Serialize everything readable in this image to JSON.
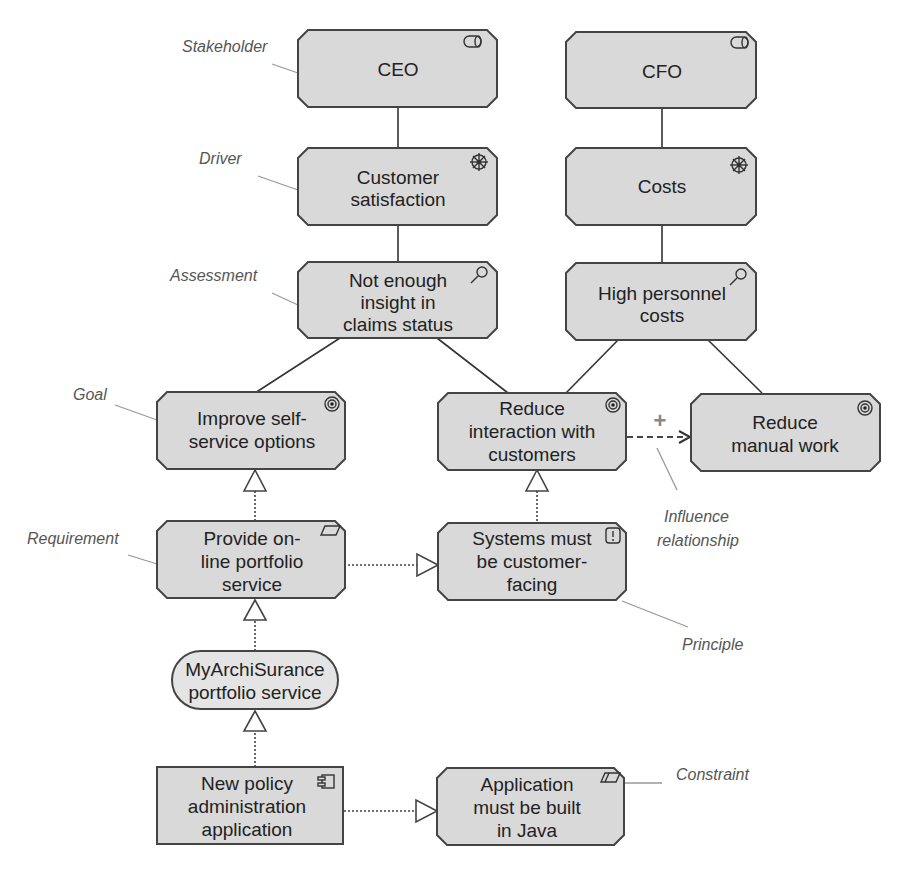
{
  "diagram": {
    "colors": {
      "node_fill": "#d9d9d9",
      "service_fill": "#e4e4e4",
      "stroke": "#444444",
      "annotation": "#555555"
    },
    "nodes": {
      "ceo": {
        "type": "Stakeholder",
        "icon": "stakeholder-icon",
        "lines": [
          "CEO"
        ]
      },
      "cfo": {
        "type": "Stakeholder",
        "icon": "stakeholder-icon",
        "lines": [
          "CFO"
        ]
      },
      "customer_satisfaction": {
        "type": "Driver",
        "icon": "driver-icon",
        "lines": [
          "Customer",
          "satisfaction"
        ]
      },
      "costs": {
        "type": "Driver",
        "icon": "driver-icon",
        "lines": [
          "Costs"
        ]
      },
      "not_enough_insight": {
        "type": "Assessment",
        "icon": "assessment-icon",
        "lines": [
          "Not enough",
          "insight in",
          "claims status"
        ]
      },
      "high_personnel_costs": {
        "type": "Assessment",
        "icon": "assessment-icon",
        "lines": [
          "High personnel",
          "costs"
        ]
      },
      "improve_self_service": {
        "type": "Goal",
        "icon": "goal-icon",
        "lines": [
          "Improve self-",
          "service options"
        ]
      },
      "reduce_interaction": {
        "type": "Goal",
        "icon": "goal-icon",
        "lines": [
          "Reduce",
          "interaction with",
          "customers"
        ]
      },
      "reduce_manual_work": {
        "type": "Goal",
        "icon": "goal-icon",
        "lines": [
          "Reduce",
          "manual work"
        ]
      },
      "provide_online_portfolio": {
        "type": "Requirement",
        "icon": "requirement-icon",
        "lines": [
          "Provide on-",
          "line portfolio",
          "service"
        ]
      },
      "systems_customer_facing": {
        "type": "Principle",
        "icon": "principle-icon",
        "lines": [
          "Systems must",
          "be customer-",
          "facing"
        ]
      },
      "myarchisurance_service": {
        "type": "Application Service",
        "icon": "",
        "lines": [
          "MyArchiSurance",
          "portfolio service"
        ]
      },
      "new_policy_admin_app": {
        "type": "Application Component",
        "icon": "component-icon",
        "lines": [
          "New policy",
          "administration",
          "application"
        ]
      },
      "application_java": {
        "type": "Constraint",
        "icon": "constraint-icon",
        "lines": [
          "Application",
          "must be built",
          "in Java"
        ]
      }
    },
    "annotations": {
      "stakeholder": "Stakeholder",
      "driver": "Driver",
      "assessment": "Assessment",
      "goal": "Goal",
      "requirement": "Requirement",
      "influence": [
        "Influence",
        "relationship"
      ],
      "principle": "Principle",
      "constraint": "Constraint"
    },
    "influence_sign": "+",
    "relationships": [
      {
        "from": "ceo",
        "to": "customer_satisfaction",
        "type": "association"
      },
      {
        "from": "cfo",
        "to": "costs",
        "type": "association"
      },
      {
        "from": "customer_satisfaction",
        "to": "not_enough_insight",
        "type": "association"
      },
      {
        "from": "costs",
        "to": "high_personnel_costs",
        "type": "association"
      },
      {
        "from": "not_enough_insight",
        "to": "improve_self_service",
        "type": "association"
      },
      {
        "from": "not_enough_insight",
        "to": "reduce_interaction",
        "type": "association"
      },
      {
        "from": "high_personnel_costs",
        "to": "reduce_interaction",
        "type": "association"
      },
      {
        "from": "high_personnel_costs",
        "to": "reduce_manual_work",
        "type": "association"
      },
      {
        "from": "reduce_interaction",
        "to": "reduce_manual_work",
        "type": "influence",
        "label": "+"
      },
      {
        "from": "provide_online_portfolio",
        "to": "improve_self_service",
        "type": "realization"
      },
      {
        "from": "systems_customer_facing",
        "to": "reduce_interaction",
        "type": "realization"
      },
      {
        "from": "provide_online_portfolio",
        "to": "systems_customer_facing",
        "type": "realization"
      },
      {
        "from": "myarchisurance_service",
        "to": "provide_online_portfolio",
        "type": "realization"
      },
      {
        "from": "new_policy_admin_app",
        "to": "myarchisurance_service",
        "type": "realization"
      },
      {
        "from": "new_policy_admin_app",
        "to": "application_java",
        "type": "realization"
      }
    ]
  }
}
